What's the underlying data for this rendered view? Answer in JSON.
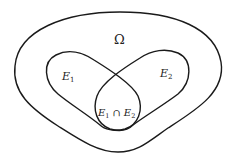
{
  "diagram": {
    "type": "venn",
    "universe": {
      "label": "Ω"
    },
    "sets": [
      {
        "id": "E1",
        "base": "E",
        "sub": "1"
      },
      {
        "id": "E2",
        "base": "E",
        "sub": "2"
      }
    ],
    "intersection": {
      "left_base": "E",
      "left_sub": "1",
      "operator": "∩",
      "right_base": "E",
      "right_sub": "2"
    },
    "colors": {
      "stroke": "#1a1a1a",
      "background": "#ffffff"
    }
  }
}
